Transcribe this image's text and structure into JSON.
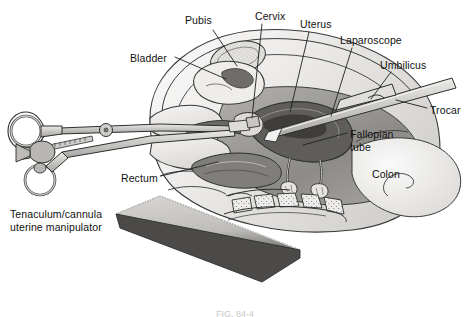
{
  "figure": {
    "background_color": "#ffffff",
    "width": 470,
    "height": 317,
    "caption": "FIG. 84-4"
  },
  "palette": {
    "outline": "#2b2b2b",
    "label_text": "#111111",
    "leader_line": "#1f1f1f",
    "skin_light": "#f2f0ee",
    "tissue_light": "#e3e1de",
    "tissue_mid": "#c8c6c3",
    "tissue_dark": "#8e8c8a",
    "organ_dark": "#6f6d6b",
    "organ_darker": "#5a5856",
    "table_dark": "#4b4a49",
    "metal_light": "#d6d4d1",
    "metal_mid": "#b3b1ae",
    "bone_stipple": "#9a9896"
  },
  "labels": [
    {
      "id": "pubis",
      "name": "Pubis",
      "lines": [
        "Pubis"
      ],
      "x": 185,
      "y": 14,
      "anchor_x": 215,
      "anchor_y": 30,
      "tip_x": 237,
      "tip_y": 66
    },
    {
      "id": "cervix",
      "name": "Cervix",
      "lines": [
        "Cervix"
      ],
      "x": 255,
      "y": 10,
      "anchor_x": 262,
      "anchor_y": 24,
      "tip_x": 250,
      "tip_y": 118
    },
    {
      "id": "uterus",
      "name": "Uterus",
      "lines": [
        "Uterus"
      ],
      "x": 300,
      "y": 18,
      "anchor_x": 310,
      "anchor_y": 32,
      "tip_x": 289,
      "tip_y": 112
    },
    {
      "id": "laparoscope",
      "name": "Laparoscope",
      "lines": [
        "Laparoscope"
      ],
      "x": 340,
      "y": 34,
      "anchor_x": 354,
      "anchor_y": 48,
      "tip_x": 330,
      "tip_y": 115
    },
    {
      "id": "umbilicus",
      "name": "Umbilicus",
      "lines": [
        "Umbilicus"
      ],
      "x": 380,
      "y": 59,
      "anchor_x": 392,
      "anchor_y": 72,
      "tip_x": 368,
      "tip_y": 100
    },
    {
      "id": "trocar",
      "name": "Trocar",
      "lines": [
        "Trocar"
      ],
      "x": 430,
      "y": 104,
      "anchor_x": 428,
      "anchor_y": 109,
      "tip_x": 398,
      "tip_y": 102
    },
    {
      "id": "bladder",
      "name": "Bladder",
      "lines": [
        "Bladder"
      ],
      "x": 130,
      "y": 52,
      "anchor_x": 176,
      "anchor_y": 58,
      "tip_x": 226,
      "tip_y": 78
    },
    {
      "id": "fallopian",
      "name": "Fallopian tube",
      "lines": [
        "Fallopian",
        "tube"
      ],
      "x": 350,
      "y": 128,
      "anchor_x": 348,
      "anchor_y": 134,
      "tip_x": 305,
      "tip_y": 144
    },
    {
      "id": "colon",
      "name": "Colon",
      "lines": [
        "Colon"
      ],
      "x": 372,
      "y": 168,
      "anchor_x": null,
      "anchor_y": null,
      "tip_x": null,
      "tip_y": null
    },
    {
      "id": "rectum",
      "name": "Rectum",
      "lines": [
        "Rectum"
      ],
      "x": 121,
      "y": 172,
      "anchor_x": 162,
      "anchor_y": 177,
      "tip_x": 218,
      "tip_y": 162
    },
    {
      "id": "manipulator",
      "name": "Tenaculum/cannula uterine manipulator",
      "lines": [
        "Tenaculum/cannula",
        "uterine manipulator"
      ],
      "x": 10,
      "y": 208,
      "anchor_x": null,
      "anchor_y": null,
      "tip_x": null,
      "tip_y": null
    }
  ],
  "structures": [
    {
      "id": "abdomen-wall",
      "name": "abdominal-wall"
    },
    {
      "id": "pubis-bone",
      "name": "pubic-bone"
    },
    {
      "id": "bladder-organ",
      "name": "bladder-organ"
    },
    {
      "id": "uterus-organ",
      "name": "uterus-organ"
    },
    {
      "id": "cervix-organ",
      "name": "cervix-organ"
    },
    {
      "id": "vagina-canal",
      "name": "vaginal-canal"
    },
    {
      "id": "tube-left",
      "name": "fallopian-tube-left"
    },
    {
      "id": "tube-right",
      "name": "fallopian-tube-right"
    },
    {
      "id": "ovary-left",
      "name": "ovary-left"
    },
    {
      "id": "ovary-right",
      "name": "ovary-right"
    },
    {
      "id": "rectum-organ",
      "name": "rectum-organ"
    },
    {
      "id": "sacrum-bone",
      "name": "sacral-vertebrae"
    },
    {
      "id": "colon-organ",
      "name": "colon-organ"
    },
    {
      "id": "scope-shaft",
      "name": "laparoscope-shaft"
    },
    {
      "id": "trocar-sleeve",
      "name": "trocar-sleeve"
    },
    {
      "id": "table-edge",
      "name": "operating-table-edge"
    },
    {
      "id": "tenaculum",
      "name": "tenaculum-instrument"
    }
  ]
}
